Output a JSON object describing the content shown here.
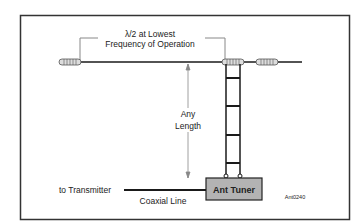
{
  "diagram": {
    "type": "antenna-schematic",
    "span_label_line1": "λ/2 at Lowest",
    "span_label_line2": "Frequency of Operation",
    "feeder_label_line1": "Any",
    "feeder_label_line2": "Length",
    "tuner_label": "Ant Tuner",
    "transmitter_label": "to Transmitter",
    "coax_label": "Coaxial Line",
    "figure_id": "Ant0240",
    "components": [
      {
        "id": "left-insulator",
        "kind": "insulator-icon"
      },
      {
        "id": "center-insulator",
        "kind": "insulator-icon"
      },
      {
        "id": "right-insulator",
        "kind": "insulator-icon"
      },
      {
        "id": "ladder-line",
        "kind": "open-wire-feedline",
        "rungs": 4
      },
      {
        "id": "antenna-tuner",
        "kind": "box"
      },
      {
        "id": "coax",
        "kind": "coaxial-line"
      }
    ],
    "colors": {
      "frame": "#333333",
      "wire": "#1a1a1a",
      "tuner_fill": "#b3b3b3",
      "dimension": "#888888",
      "insulator": "#cccccc"
    }
  }
}
